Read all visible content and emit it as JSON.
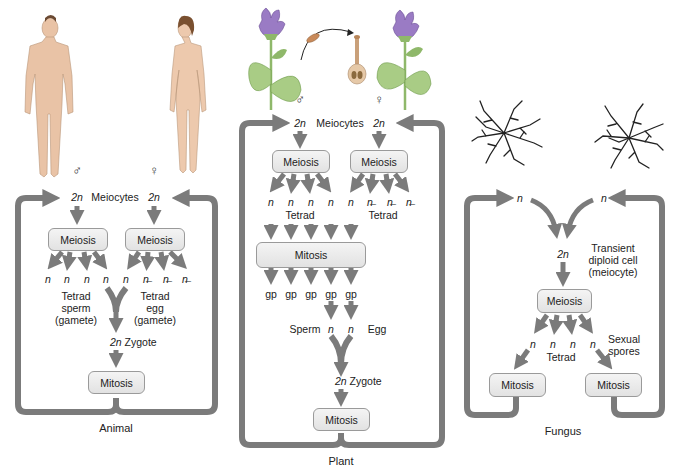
{
  "colors": {
    "arrow": "#7b7b7b",
    "box_fill": "#e9e9e9",
    "box_border": "#9a9a9a",
    "skin": "#e9c3a6",
    "flower": "#9a7bc4",
    "leaf": "#8fb86a",
    "hypha": "#222222"
  },
  "animal": {
    "title": "Animal",
    "male_symbol": "♂",
    "female_symbol": "♀",
    "meiocytes": {
      "left_ploidy": "2n",
      "label": "Meiocytes",
      "right_ploidy": "2n"
    },
    "meiosis_left": "Meiosis",
    "meiosis_right": "Meiosis",
    "haploid_row": [
      "n",
      "n",
      "n",
      "n",
      "n",
      "n̶",
      "n̶",
      "n̶"
    ],
    "sperm_label": {
      "l1": "Tetrad",
      "l2": "sperm",
      "l3": "(gamete)"
    },
    "egg_label": {
      "l1": "Tetrad",
      "l2": "egg",
      "l3": "(gamete)"
    },
    "zygote": {
      "ploidy": "2n",
      "label": "Zygote"
    },
    "mitosis": "Mitosis"
  },
  "plant": {
    "title": "Plant",
    "male_symbol": "♂",
    "female_symbol": "♀",
    "meiocytes": {
      "left_ploidy": "2n",
      "label": "Meiocytes",
      "right_ploidy": "2n"
    },
    "meiosis_left": "Meiosis",
    "meiosis_right": "Meiosis",
    "haploid_row": [
      "n",
      "n",
      "n",
      "n",
      "n",
      "n̶",
      "n̶",
      "n̶"
    ],
    "tetrad_left": "Tetrad",
    "tetrad_right": "Tetrad",
    "mitosis_wide": "Mitosis",
    "gp_row": [
      "gp",
      "gp",
      "gp",
      "gp",
      "gp"
    ],
    "sperm": "Sperm",
    "egg": "Egg",
    "gamete_n": [
      "n",
      "n"
    ],
    "zygote": {
      "ploidy": "2n",
      "label": "Zygote"
    },
    "mitosis": "Mitosis"
  },
  "fungus": {
    "title": "Fungus",
    "top_n": [
      "n",
      "n"
    ],
    "diploid": {
      "ploidy": "2n",
      "l1": "Transient",
      "l2": "diploid cell",
      "l3": "(meiocyte)"
    },
    "meiosis": "Meiosis",
    "haploid_row": [
      "n",
      "n",
      "n",
      "n"
    ],
    "tetrad": "Tetrad",
    "sexual_spores": {
      "l1": "Sexual",
      "l2": "spores"
    },
    "mitosis_left": "Mitosis",
    "mitosis_right": "Mitosis"
  }
}
